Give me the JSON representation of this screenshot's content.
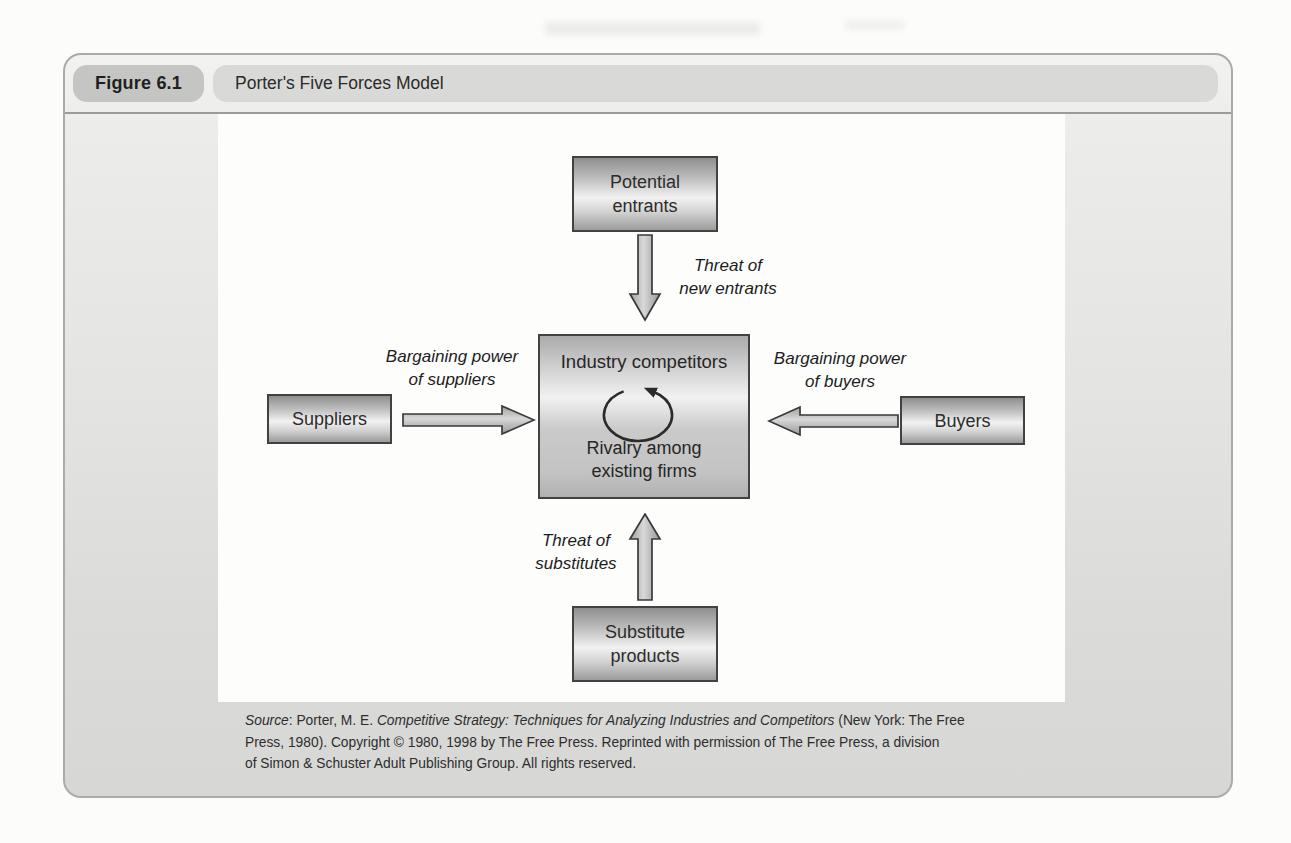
{
  "figure": {
    "label": "Figure 6.1",
    "title": "Porter's Five Forces Model"
  },
  "diagram": {
    "nodes": {
      "potential_entrants": {
        "line1": "Potential",
        "line2": "entrants"
      },
      "suppliers": {
        "label": "Suppliers"
      },
      "industry_competitors": {
        "title": "Industry competitors",
        "sub_line1": "Rivalry among",
        "sub_line2": "existing firms"
      },
      "buyers": {
        "label": "Buyers"
      },
      "substitute_products": {
        "line1": "Substitute",
        "line2": "products"
      }
    },
    "forces": {
      "threat_new_entrants": {
        "line1": "Threat of",
        "line2": "new entrants"
      },
      "bargaining_suppliers": {
        "line1": "Bargaining power",
        "line2": "of suppliers"
      },
      "bargaining_buyers": {
        "line1": "Bargaining power",
        "line2": "of buyers"
      },
      "threat_substitutes": {
        "line1": "Threat of",
        "line2": "substitutes"
      }
    },
    "icons": {
      "rivalry_cycle_icon": "circular-arrow-counterclockwise"
    }
  },
  "source": {
    "label": "Source",
    "line1_mid": ": Porter, M. E. ",
    "book": "Competitive Strategy: Techniques for Analyzing Industries and Competitors",
    "line1_end": " (New York: The Free",
    "line2": "Press, 1980). Copyright © 1980, 1998 by The Free Press. Reprinted with permission of The Free Press, a division",
    "line3": "of Simon & Schuster Adult Publishing Group. All rights reserved."
  },
  "colors": {
    "panel_gray": "#dcdcda",
    "badge_gray": "#c5c5c3",
    "titlebar_gray": "#d9d9d7",
    "box_border": "#424242",
    "box_fill_light": "#f2f2f2",
    "box_fill_dark": "#8f8f8f",
    "arrow_fill": "#bdbdbd",
    "text_dark": "#2c2c2c"
  }
}
